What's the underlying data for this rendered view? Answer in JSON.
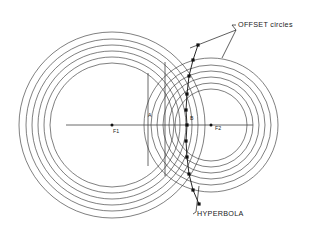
{
  "figure": {
    "background_color": "#ffffff",
    "line_color": "#3a3a3a",
    "marker_color": "#101010",
    "text_color": "#1a1a1a",
    "width": 320,
    "height": 250
  },
  "callouts": [
    {
      "id": "offset-circles",
      "text": "OFFSET circles",
      "x": 238,
      "y": 27
    },
    {
      "id": "hyperbola",
      "text": "HYPERBOLA",
      "x": 197,
      "y": 216
    }
  ],
  "point_labels": [
    {
      "id": "f1",
      "text": "F1",
      "x": 113,
      "y": 133
    },
    {
      "id": "a",
      "text": "A",
      "x": 148,
      "y": 117
    },
    {
      "id": "b",
      "text": "B",
      "x": 190,
      "y": 120
    },
    {
      "id": "f2",
      "text": "F2",
      "x": 215,
      "y": 130
    }
  ],
  "chart_data": {
    "type": "diagram",
    "focus_1": {
      "label": "F1",
      "cx": 112,
      "cy": 125
    },
    "focus_2": {
      "label": "F2",
      "cx": 211,
      "cy": 125
    },
    "vertex_a": {
      "label": "A",
      "x": 148,
      "y": 125
    },
    "vertex_b": {
      "label": "B",
      "x": 187,
      "y": 125
    },
    "circles_f1": {
      "center": [
        112,
        125
      ],
      "radii": [
        62,
        68,
        74,
        80,
        86,
        93
      ],
      "count": 6
    },
    "circles_f2": {
      "center": [
        211,
        125
      ],
      "radii": [
        36,
        42,
        48,
        54,
        60,
        67
      ],
      "count": 6
    },
    "axis_line": {
      "x1": 66,
      "y1": 125,
      "x2": 253,
      "y2": 125
    },
    "vertical_lines": [
      {
        "x": 148,
        "y1": 73,
        "y2": 166
      },
      {
        "x": 165,
        "y1": 62,
        "y2": 176
      }
    ],
    "hyperbola_points": [
      [
        198,
        45
      ],
      [
        193,
        60
      ],
      [
        189,
        76
      ],
      [
        187,
        94
      ],
      [
        186,
        110
      ],
      [
        187,
        125
      ],
      [
        186,
        141
      ],
      [
        187,
        157
      ],
      [
        189,
        174
      ],
      [
        193,
        190
      ],
      [
        199,
        204
      ]
    ],
    "leader_lines": [
      {
        "from": [
          236,
          30
        ],
        "to": [
          190,
          48
        ]
      },
      {
        "from": [
          236,
          30
        ],
        "to": [
          222,
          58
        ]
      },
      {
        "from": [
          196,
          212
        ],
        "to": [
          199,
          186
        ]
      }
    ]
  }
}
